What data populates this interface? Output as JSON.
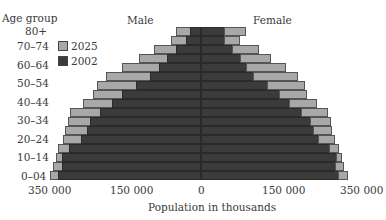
{
  "chart_data": {
    "type": "bar",
    "subtype": "population-pyramid",
    "title": "",
    "xlabel": "Population in thousands",
    "ylabel": "Age group",
    "side_labels": {
      "left": "Male",
      "right": "Female"
    },
    "x_ticks": [
      "350 000",
      "150 000",
      "0",
      "150 000",
      "350 000"
    ],
    "xlim": [
      -350000,
      350000
    ],
    "y_tick_labels": [
      "80+",
      "70–74",
      "60–64",
      "50–54",
      "40–44",
      "30–34",
      "20–24",
      "10–14",
      "0–04"
    ],
    "legend": [
      {
        "name": "2025",
        "color": "#a8a8a8"
      },
      {
        "name": "2002",
        "color": "#3b3b3b"
      }
    ],
    "categories": [
      "80+",
      "75–79",
      "70–74",
      "65–69",
      "60–64",
      "55–59",
      "50–54",
      "45–49",
      "40–44",
      "35–39",
      "30–34",
      "25–29",
      "20–24",
      "15–19",
      "10–14",
      "5–9",
      "0–04"
    ],
    "series": [
      {
        "name": "Male 2025",
        "values": [
          57000,
          68000,
          107000,
          141000,
          180000,
          216000,
          236000,
          245000,
          268000,
          298000,
          302000,
          309000,
          314000,
          325000,
          330000,
          336000,
          343000
        ]
      },
      {
        "name": "Male 2002",
        "values": [
          25000,
          34000,
          57000,
          77000,
          95000,
          116000,
          148000,
          180000,
          202000,
          230000,
          252000,
          259000,
          273000,
          300000,
          316000,
          316000,
          325000
        ]
      },
      {
        "name": "Female 2025",
        "values": [
          102000,
          89000,
          132000,
          159000,
          193000,
          220000,
          236000,
          241000,
          264000,
          289000,
          295000,
          298000,
          305000,
          314000,
          320000,
          325000,
          334000
        ]
      },
      {
        "name": "Female 2002",
        "values": [
          55000,
          55000,
          73000,
          91000,
          105000,
          120000,
          152000,
          180000,
          202000,
          230000,
          250000,
          257000,
          268000,
          293000,
          309000,
          307000,
          314000
        ]
      }
    ],
    "grid": false,
    "legend_position": "upper-left"
  },
  "labels": {
    "age_group": "Age group",
    "male": "Male",
    "female": "Female",
    "xlabel": "Population in thousands",
    "legend_2025": "2025",
    "legend_2002": "2002",
    "tick_l350": "350 000",
    "tick_l150": "150 000",
    "tick_0": "0",
    "tick_r150": "150 000",
    "tick_r350": "350 000",
    "age_80": "80+",
    "age_70": "70–74",
    "age_60": "60–64",
    "age_50": "50–54",
    "age_40": "40–44",
    "age_30": "30–34",
    "age_20": "20–24",
    "age_10": "10–14",
    "age_0": "0–04"
  }
}
